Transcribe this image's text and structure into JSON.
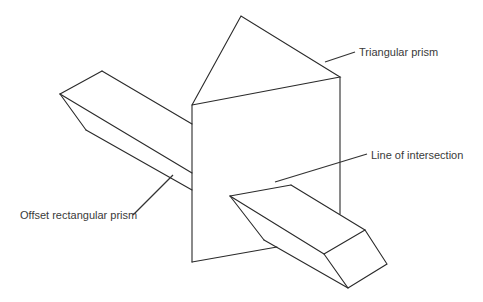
{
  "diagram": {
    "labels": {
      "triangular_prism": "Triangular prism",
      "line_of_intersection": "Line of intersection",
      "offset_rectangular_prism": "Offset rectangular prism"
    },
    "colors": {
      "stroke": "#2a2a2a",
      "text": "#3a3a3a",
      "background": "#ffffff"
    }
  }
}
